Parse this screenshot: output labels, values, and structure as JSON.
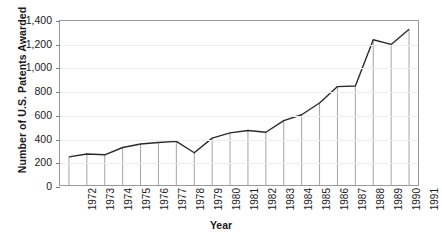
{
  "chart_data": {
    "type": "line",
    "title": "",
    "xlabel": "Year",
    "ylabel": "Number of U.S. Patents Awarded",
    "categories": [
      "1972",
      "1973",
      "1974",
      "1975",
      "1976",
      "1977",
      "1978",
      "1979",
      "1980",
      "1981",
      "1982",
      "1983",
      "1984",
      "1985",
      "1986",
      "1987",
      "1988",
      "1989",
      "1990",
      "1991"
    ],
    "values": [
      240,
      265,
      258,
      320,
      350,
      363,
      372,
      275,
      400,
      445,
      465,
      450,
      550,
      600,
      700,
      840,
      845,
      1240,
      1200,
      1330
    ],
    "ylim": [
      0,
      1400
    ],
    "yticks": [
      0,
      200,
      400,
      600,
      800,
      1000,
      1200,
      1400
    ],
    "ytick_labels": [
      "0",
      "200",
      "400",
      "600",
      "800",
      "1,000",
      "1,200",
      "1,400"
    ],
    "grid": true,
    "legend": "none",
    "series_color": "#2b2b2b",
    "droplines": true,
    "dropline_color": "#8c8c8c",
    "grid_color": "#ededed",
    "frame_color": "#9a9a9a"
  }
}
